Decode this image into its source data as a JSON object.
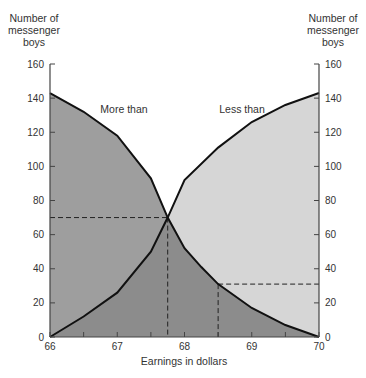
{
  "chart_data": {
    "type": "area",
    "title": "",
    "xlabel": "Earnings in dollars",
    "ylabel_left": "Number of messenger boys",
    "ylabel_right": "Number of messenger boys",
    "xlim": [
      66,
      70
    ],
    "ylim": [
      0,
      160
    ],
    "x_ticks": [
      66,
      67,
      68,
      69,
      70
    ],
    "x_minor_ticks": [
      66.5,
      67.5,
      68.5,
      69.5
    ],
    "y_ticks": [
      0,
      20,
      40,
      60,
      80,
      100,
      120,
      140,
      160
    ],
    "grid": false,
    "legend": "inline annotations",
    "series": [
      {
        "name": "More than",
        "x": [
          66,
          66.5,
          67,
          67.5,
          67.75,
          68,
          68.25,
          68.5,
          69,
          69.5,
          70
        ],
        "values": [
          143,
          132,
          118,
          93,
          70,
          52,
          41,
          31,
          17,
          7,
          0
        ],
        "fill": "#9e9e9e"
      },
      {
        "name": "Less than",
        "x": [
          66,
          66.5,
          67,
          67.5,
          67.75,
          68,
          68.5,
          69,
          69.5,
          70
        ],
        "values": [
          0,
          12,
          26,
          50,
          70,
          92,
          111,
          126,
          136,
          143
        ],
        "fill": "#d6d6d6"
      }
    ],
    "annotations": [
      {
        "type": "dashed-guide",
        "x": 67.75,
        "y": 70,
        "side": "left",
        "note": "intersection of ogives (median)"
      },
      {
        "type": "dashed-guide",
        "x": 68.5,
        "y": 31,
        "side": "right"
      }
    ]
  },
  "labels": {
    "left_axis_title": [
      "Number of",
      "messenger",
      "boys"
    ],
    "right_axis_title": [
      "Number of",
      "messenger",
      "boys"
    ],
    "x_axis_title": "Earnings in dollars",
    "more_than": "More than",
    "less_than": "Less than"
  }
}
